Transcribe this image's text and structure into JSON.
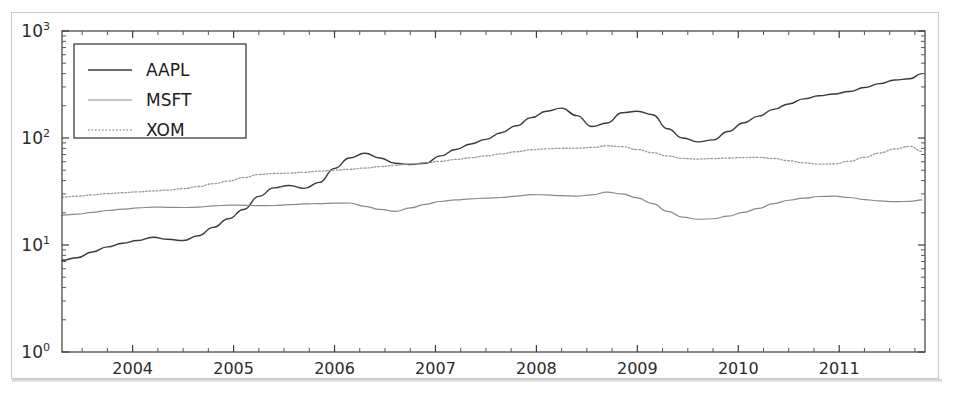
{
  "figure": {
    "background_color": "#ffffff",
    "frame_color": "#c9c9c9"
  },
  "chart_data": {
    "type": "line",
    "title": "",
    "xlabel": "",
    "ylabel": "",
    "yscale": "log",
    "xscale": "linear",
    "grid": false,
    "legend_position": "upper left",
    "xlim": [
      2003.3,
      2011.85
    ],
    "ylim": [
      1,
      1000
    ],
    "y_tick_labels": [
      "10^0",
      "10^1",
      "10^2",
      "10^3"
    ],
    "y_tick_values": [
      1,
      10,
      100,
      1000
    ],
    "x_tick_labels": [
      "2004",
      "2005",
      "2006",
      "2007",
      "2008",
      "2009",
      "2010",
      "2011"
    ],
    "x_tick_values": [
      2004,
      2005,
      2006,
      2007,
      2008,
      2009,
      2010,
      2011
    ],
    "x": [
      2003.3,
      2003.45,
      2003.6,
      2003.75,
      2003.9,
      2004.05,
      2004.2,
      2004.35,
      2004.5,
      2004.65,
      2004.8,
      2004.95,
      2005.1,
      2005.25,
      2005.4,
      2005.55,
      2005.7,
      2005.85,
      2006.0,
      2006.15,
      2006.3,
      2006.45,
      2006.6,
      2006.75,
      2006.9,
      2007.05,
      2007.2,
      2007.35,
      2007.5,
      2007.65,
      2007.8,
      2007.95,
      2008.1,
      2008.25,
      2008.4,
      2008.55,
      2008.7,
      2008.85,
      2009.0,
      2009.15,
      2009.3,
      2009.45,
      2009.6,
      2009.75,
      2009.9,
      2010.05,
      2010.2,
      2010.35,
      2010.5,
      2010.65,
      2010.8,
      2010.95,
      2011.1,
      2011.25,
      2011.4,
      2011.55,
      2011.7,
      2011.82
    ],
    "series": [
      {
        "name": "AAPL",
        "color": "#3a3a3a",
        "linestyle": "solid",
        "linewidth": 1.4,
        "values": [
          7.2,
          7.6,
          8.6,
          9.6,
          10.4,
          11.0,
          11.8,
          11.3,
          11.0,
          12.2,
          14.6,
          17.6,
          21.5,
          28.5,
          34.2,
          36.0,
          33.8,
          38.5,
          52.0,
          65.0,
          72.0,
          65.0,
          58.0,
          56.5,
          58.0,
          68.0,
          78.0,
          88.0,
          97.0,
          112.0,
          130.0,
          155.0,
          178.0,
          190.0,
          162.0,
          128.0,
          138.0,
          172.0,
          178.0,
          165.0,
          122.0,
          100.0,
          92.0,
          96.0,
          115.0,
          138.0,
          160.0,
          185.0,
          208.0,
          232.0,
          248.0,
          258.0,
          272.0,
          296.0,
          322.0,
          348.0,
          358.0,
          400.0
        ]
      },
      {
        "name": "MSFT",
        "color": "#8a8a8a",
        "linestyle": "solid",
        "linewidth": 1.2,
        "values": [
          19.0,
          19.4,
          20.2,
          21.0,
          21.6,
          22.2,
          22.6,
          22.5,
          22.4,
          22.6,
          23.2,
          23.6,
          23.5,
          23.3,
          23.4,
          23.8,
          24.2,
          24.4,
          24.6,
          24.7,
          23.0,
          21.5,
          20.6,
          22.2,
          24.0,
          25.5,
          26.4,
          27.0,
          27.4,
          27.8,
          28.6,
          29.6,
          29.4,
          28.9,
          28.6,
          29.4,
          31.2,
          30.0,
          27.6,
          24.4,
          20.6,
          18.2,
          17.4,
          17.6,
          18.6,
          20.2,
          22.0,
          24.4,
          26.2,
          27.4,
          28.4,
          28.6,
          27.8,
          26.6,
          25.8,
          25.4,
          25.6,
          26.4
        ]
      },
      {
        "name": "XOM",
        "color": "#9a9a9a",
        "linestyle": "dotted",
        "linewidth": 1.3,
        "values": [
          28.0,
          28.6,
          29.4,
          30.2,
          30.8,
          31.4,
          32.0,
          32.6,
          33.6,
          35.2,
          37.4,
          39.6,
          42.6,
          45.6,
          46.6,
          47.0,
          47.8,
          49.0,
          50.0,
          51.0,
          52.4,
          54.0,
          55.6,
          57.2,
          58.6,
          60.6,
          63.0,
          65.4,
          68.0,
          71.0,
          74.4,
          77.6,
          79.2,
          80.2,
          80.4,
          81.6,
          84.4,
          83.0,
          78.0,
          73.0,
          68.0,
          64.4,
          63.6,
          64.2,
          65.0,
          65.6,
          66.0,
          64.4,
          61.4,
          58.6,
          57.0,
          57.2,
          60.6,
          66.0,
          72.4,
          79.0,
          83.6,
          75.0
        ]
      }
    ]
  },
  "legend": {
    "entries": [
      {
        "label": "AAPL",
        "swatch": "solid-dark-line"
      },
      {
        "label": "MSFT",
        "swatch": "solid-gray-line"
      },
      {
        "label": "XOM",
        "swatch": "dotted-gray-line"
      }
    ]
  }
}
